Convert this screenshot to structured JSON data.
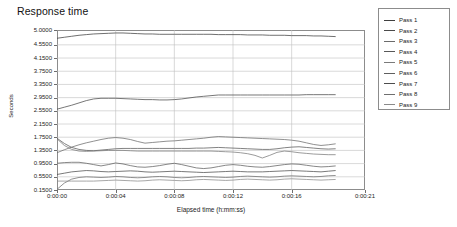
{
  "chart_data": {
    "type": "line",
    "title": "Response time",
    "xlabel": "Elapsed time (h:mm:ss)",
    "ylabel": "Seconds",
    "grid": true,
    "legend_position": "right",
    "ylim": [
      0.15,
      5.0
    ],
    "xlim": [
      0,
      21
    ],
    "ytick_labels": [
      "5.0000",
      "4.5500",
      "4.1500",
      "3.7500",
      "3.3500",
      "2.9500",
      "2.5500",
      "2.1500",
      "1.7500",
      "1.3500",
      "0.9500",
      "0.5500",
      "0.1500"
    ],
    "ytick_values": [
      5.0,
      4.55,
      4.15,
      3.75,
      3.35,
      2.95,
      2.55,
      2.15,
      1.75,
      1.35,
      0.95,
      0.55,
      0.15
    ],
    "xtick_labels": [
      "0:00:00",
      "0:00:04",
      "0:00:08",
      "0:00:12",
      "0:00:16",
      "0:00:21"
    ],
    "xtick_values": [
      0,
      4,
      8,
      12,
      16,
      21
    ],
    "x": [
      0,
      0.5,
      1,
      1.5,
      2,
      2.5,
      3,
      3.5,
      4,
      4.5,
      5,
      5.5,
      6,
      6.5,
      7,
      7.5,
      8,
      8.5,
      9,
      9.5,
      10,
      10.5,
      11,
      11.5,
      12,
      12.5,
      13,
      13.5,
      14,
      14.5,
      15,
      15.5,
      16,
      16.5,
      17,
      17.5,
      18,
      18.5,
      19
    ],
    "series": [
      {
        "name": "Pass 1",
        "color": "#3f3f3f",
        "values": [
          4.75,
          4.78,
          4.81,
          4.84,
          4.86,
          4.88,
          4.89,
          4.9,
          4.91,
          4.91,
          4.9,
          4.89,
          4.88,
          4.88,
          4.87,
          4.87,
          4.87,
          4.87,
          4.87,
          4.87,
          4.87,
          4.87,
          4.86,
          4.86,
          4.86,
          4.86,
          4.85,
          4.85,
          4.85,
          4.84,
          4.84,
          4.84,
          4.83,
          4.83,
          4.83,
          4.82,
          4.82,
          4.81,
          4.8
        ]
      },
      {
        "name": "Pass 2",
        "color": "#4a4a4a",
        "values": [
          2.6,
          2.66,
          2.72,
          2.79,
          2.86,
          2.91,
          2.93,
          2.93,
          2.93,
          2.92,
          2.91,
          2.9,
          2.89,
          2.89,
          2.88,
          2.88,
          2.89,
          2.91,
          2.94,
          2.97,
          2.99,
          3.01,
          3.03,
          3.03,
          3.03,
          3.03,
          3.03,
          3.03,
          3.03,
          3.03,
          3.03,
          3.03,
          3.03,
          3.03,
          3.04,
          3.04,
          3.04,
          3.04,
          3.04
        ]
      },
      {
        "name": "Pass 3",
        "color": "#6b6b6b",
        "values": [
          1.28,
          1.37,
          1.45,
          1.52,
          1.58,
          1.63,
          1.68,
          1.72,
          1.74,
          1.72,
          1.68,
          1.62,
          1.57,
          1.59,
          1.61,
          1.63,
          1.64,
          1.66,
          1.68,
          1.7,
          1.72,
          1.75,
          1.77,
          1.76,
          1.75,
          1.74,
          1.73,
          1.72,
          1.71,
          1.7,
          1.69,
          1.68,
          1.66,
          1.63,
          1.58,
          1.53,
          1.5,
          1.52,
          1.55
        ]
      },
      {
        "name": "Pass 4",
        "color": "#585858",
        "values": [
          1.72,
          1.56,
          1.44,
          1.38,
          1.35,
          1.34,
          1.36,
          1.38,
          1.4,
          1.41,
          1.41,
          1.41,
          1.41,
          1.41,
          1.41,
          1.41,
          1.41,
          1.41,
          1.41,
          1.42,
          1.42,
          1.43,
          1.44,
          1.43,
          1.42,
          1.41,
          1.4,
          1.39,
          1.38,
          1.38,
          1.4,
          1.43,
          1.45,
          1.46,
          1.44,
          1.42,
          1.4,
          1.39,
          1.4
        ]
      },
      {
        "name": "Pass 5",
        "color": "#7a7a7a",
        "values": [
          1.7,
          1.5,
          1.38,
          1.33,
          1.32,
          1.33,
          1.34,
          1.35,
          1.35,
          1.35,
          1.34,
          1.33,
          1.33,
          1.33,
          1.33,
          1.33,
          1.33,
          1.33,
          1.33,
          1.33,
          1.33,
          1.33,
          1.32,
          1.31,
          1.3,
          1.28,
          1.25,
          1.2,
          1.12,
          1.2,
          1.29,
          1.33,
          1.31,
          1.28,
          1.26,
          1.24,
          1.23,
          1.22,
          1.22
        ]
      },
      {
        "name": "Pass 6",
        "color": "#5f5f5f",
        "values": [
          0.96,
          0.98,
          0.99,
          0.99,
          0.96,
          0.92,
          0.88,
          0.92,
          0.97,
          0.94,
          0.89,
          0.85,
          0.84,
          0.86,
          0.89,
          0.93,
          0.96,
          0.92,
          0.87,
          0.82,
          0.8,
          0.82,
          0.86,
          0.9,
          0.92,
          0.9,
          0.87,
          0.85,
          0.84,
          0.86,
          0.89,
          0.92,
          0.94,
          0.93,
          0.9,
          0.87,
          0.85,
          0.86,
          0.88
        ]
      },
      {
        "name": "Pass 7",
        "color": "#4d4d4d",
        "values": [
          0.62,
          0.66,
          0.7,
          0.72,
          0.74,
          0.73,
          0.71,
          0.7,
          0.71,
          0.72,
          0.73,
          0.72,
          0.7,
          0.69,
          0.7,
          0.71,
          0.72,
          0.71,
          0.7,
          0.69,
          0.68,
          0.69,
          0.7,
          0.71,
          0.72,
          0.71,
          0.7,
          0.7,
          0.7,
          0.71,
          0.72,
          0.73,
          0.74,
          0.73,
          0.72,
          0.71,
          0.7,
          0.72,
          0.74
        ]
      },
      {
        "name": "Pass 8",
        "color": "#6e6e6e",
        "values": [
          0.17,
          0.36,
          0.48,
          0.53,
          0.55,
          0.54,
          0.53,
          0.54,
          0.56,
          0.55,
          0.53,
          0.52,
          0.53,
          0.55,
          0.56,
          0.55,
          0.53,
          0.52,
          0.53,
          0.55,
          0.56,
          0.55,
          0.54,
          0.53,
          0.54,
          0.56,
          0.57,
          0.56,
          0.55,
          0.54,
          0.55,
          0.57,
          0.58,
          0.57,
          0.56,
          0.55,
          0.56,
          0.58,
          0.59
        ]
      },
      {
        "name": "Pass 9",
        "color": "#8a8a8a",
        "values": [
          0.42,
          0.42,
          0.42,
          0.42,
          0.42,
          0.42,
          0.43,
          0.44,
          0.45,
          0.44,
          0.43,
          0.42,
          0.43,
          0.45,
          0.46,
          0.45,
          0.44,
          0.43,
          0.44,
          0.46,
          0.47,
          0.46,
          0.45,
          0.44,
          0.45,
          0.47,
          0.48,
          0.47,
          0.46,
          0.45,
          0.46,
          0.48,
          0.49,
          0.48,
          0.47,
          0.46,
          0.45,
          0.46,
          0.47
        ]
      }
    ]
  },
  "legend": {
    "items": [
      {
        "label": "Pass 1"
      },
      {
        "label": "Pass 2"
      },
      {
        "label": "Pass 3"
      },
      {
        "label": "Pass 4"
      },
      {
        "label": "Pass 5"
      },
      {
        "label": "Pass 6"
      },
      {
        "label": "Pass 7"
      },
      {
        "label": "Pass 8"
      },
      {
        "label": "Pass 9"
      }
    ]
  }
}
